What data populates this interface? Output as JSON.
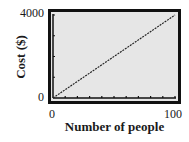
{
  "chart_data": {
    "type": "line",
    "title": "",
    "xlabel": "Number of people",
    "ylabel": "Cost ($)",
    "xlim": [
      0,
      100
    ],
    "ylim": [
      0,
      4000
    ],
    "x_tick_labels": [
      "0",
      "100"
    ],
    "y_tick_labels": [
      "0",
      "4000"
    ],
    "x_minor_ticks": 10,
    "y_minor_ticks": 4,
    "grid": false,
    "legend": null,
    "series": [
      {
        "name": "Cost",
        "x": [
          0,
          100
        ],
        "y": [
          0,
          4000
        ],
        "style": "dotted-dark"
      }
    ]
  },
  "colors": {
    "screen_bg": "#e6e6e6",
    "frame": "#111111",
    "line": "#222222"
  }
}
